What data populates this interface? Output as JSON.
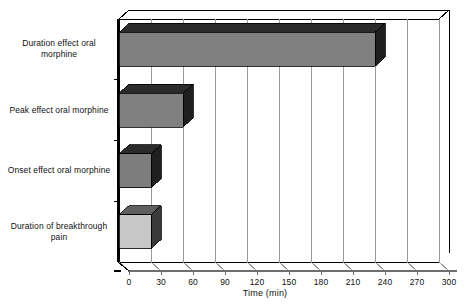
{
  "chart_data": {
    "type": "bar",
    "orientation": "horizontal",
    "style": "3d",
    "title": "",
    "xlabel": "Time (min)",
    "ylabel": "",
    "xlim": [
      0,
      300
    ],
    "xticks": [
      0,
      30,
      60,
      90,
      120,
      150,
      180,
      210,
      240,
      270,
      300
    ],
    "xtick_labels": [
      "0",
      "30",
      "60",
      "90",
      "120",
      "150",
      "180",
      "210",
      "240",
      "270",
      "300"
    ],
    "grid": true,
    "legend": "none",
    "categories": [
      "Duration effect oral morphine",
      "Peak effect oral morphine",
      "Onset effect oral morphine",
      "Duration of breakthrough pain"
    ],
    "values": [
      240,
      60,
      30,
      30
    ],
    "bar_colors": [
      "#808080",
      "#808080",
      "#7d7d7d",
      "#c8c8c8"
    ],
    "bar_top_colors": [
      "#2b2b2b",
      "#2b2b2b",
      "#2b2b2b",
      "#5f5f5f"
    ],
    "bar_side_colors": [
      "#1f1f1f",
      "#1f1f1f",
      "#1f1f1f",
      "#3a3a3a"
    ]
  },
  "axis": {
    "x_title": "Time (min)",
    "tick_labels": [
      "0",
      "30",
      "60",
      "90",
      "120",
      "150",
      "180",
      "210",
      "240",
      "270",
      "300"
    ]
  },
  "category_labels": [
    {
      "line1": "Duration effect oral",
      "line2": "morphine"
    },
    {
      "line1": "Peak effect oral morphine",
      "line2": ""
    },
    {
      "line1": "Onset effect oral morphine",
      "line2": ""
    },
    {
      "line1": "Duration of breakthrough",
      "line2": "pain"
    }
  ],
  "colors": {
    "frame": "#000000",
    "grid": "#9a9a9a",
    "background": "#ffffff",
    "text": "#111111"
  }
}
